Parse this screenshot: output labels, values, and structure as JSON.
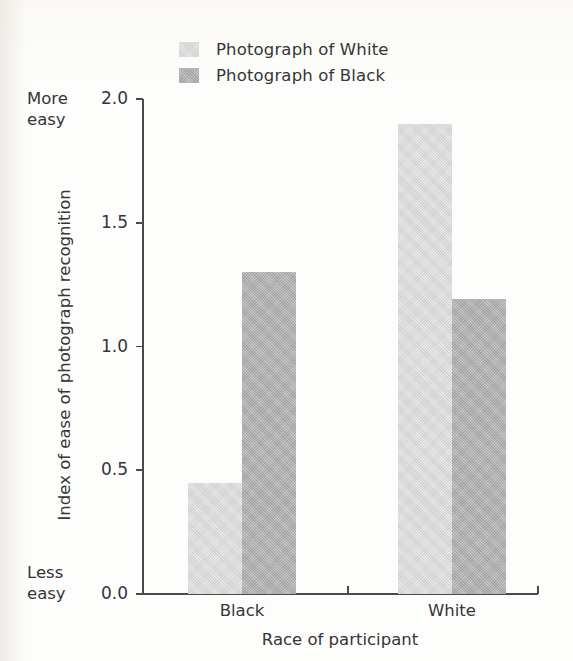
{
  "chart_data": {
    "type": "bar",
    "title": "",
    "subtitle": "",
    "xlabel": "Race of participant",
    "ylabel": "Index of ease of photograph recognition",
    "categories": [
      "Black",
      "White"
    ],
    "series": [
      {
        "name": "Photograph of White",
        "values": [
          0.45,
          1.9
        ],
        "color": "#e9e9e9"
      },
      {
        "name": "Photograph of Black",
        "values": [
          1.3,
          1.19
        ],
        "color": "#c6c6c6"
      }
    ],
    "ylim": [
      0.0,
      2.0
    ],
    "yticks": [
      "0.0",
      "0.5",
      "1.0",
      "1.5",
      "2.0"
    ],
    "ytick_values": [
      0.0,
      0.5,
      1.0,
      1.5,
      2.0
    ],
    "grid": false,
    "legend_position": "top-center",
    "axis_anchors": {
      "high_line1": "More",
      "high_line2": "easy",
      "low_line1": "Less",
      "low_line2": "easy"
    }
  },
  "legend": {
    "items": [
      {
        "label": "Photograph of White"
      },
      {
        "label": "Photograph of Black"
      }
    ]
  },
  "colors": {
    "background": "#fdfdfb",
    "axis": "#4a4a4a",
    "text": "#35353a",
    "bar_light": "#e9e9e9",
    "bar_dark": "#c6c6c6"
  }
}
